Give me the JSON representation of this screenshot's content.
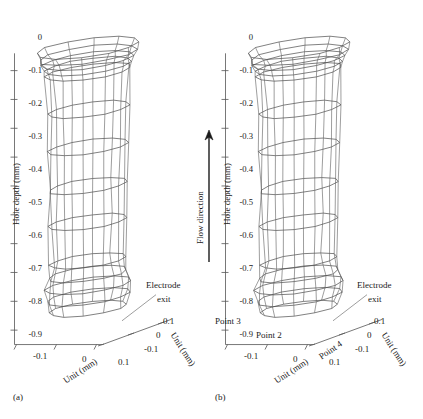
{
  "figure": {
    "type": "two-panel-3d-wireframe",
    "background": "#ffffff",
    "line_color": "#4a4a4a"
  },
  "chart_data": {
    "type": "line",
    "title": "",
    "panels": [
      {
        "caption": "(a)",
        "ylabel": "Hole depth (mm)",
        "xlabel": "Unit (mm)",
        "zlabel": "Unit (mm)",
        "yticks": [
          "0",
          "-0.1",
          "-0.2",
          "-0.3",
          "-0.4",
          "-0.5",
          "-0.6",
          "-0.7",
          "-0.8",
          "-0.9"
        ],
        "ytick_values": [
          0,
          -0.1,
          -0.2,
          -0.3,
          -0.4,
          -0.5,
          -0.6,
          -0.7,
          -0.8,
          -0.9
        ],
        "xticks": [
          "-0.1",
          "0",
          "0.1"
        ],
        "xtick_values": [
          -0.1,
          0,
          0.1
        ],
        "zticks": [
          "0.1",
          "0",
          "-0.1"
        ],
        "ztick_values": [
          0.1,
          0,
          -0.1
        ],
        "ylim": [
          -0.95,
          0.08
        ],
        "xlim": [
          -0.12,
          0.12
        ],
        "zlim": [
          -0.12,
          0.12
        ],
        "annotations": [
          "Electrode exit"
        ],
        "point_labels": [],
        "ring_depths": [
          0.04,
          0.015,
          -0.005,
          -0.025,
          -0.045,
          -0.175,
          -0.305,
          -0.44,
          -0.565,
          -0.7,
          -0.745,
          -0.785,
          -0.825,
          -0.865
        ],
        "ring_radii": [
          0.105,
          0.098,
          0.092,
          0.088,
          0.086,
          0.082,
          0.08,
          0.079,
          0.078,
          0.076,
          0.08,
          0.085,
          0.084,
          0.078
        ],
        "description": "Wireframe of a drilled hole profile, flared inlet at top, slightly tapering bore, bulged electrode exit at bottom."
      },
      {
        "caption": "(b)",
        "ylabel": "Hole depth (mm)",
        "xlabel": "Unit (mm)",
        "zlabel": "Unit (mm)",
        "yticks": [
          "0",
          "-0.1",
          "-0.2",
          "-0.3",
          "-0.4",
          "-0.5",
          "-0.6",
          "-0.7",
          "-0.8",
          "-0.9"
        ],
        "ytick_values": [
          0,
          -0.1,
          -0.2,
          -0.3,
          -0.4,
          -0.5,
          -0.6,
          -0.7,
          -0.8,
          -0.9
        ],
        "xticks": [
          "-0.1",
          "0",
          "0.1"
        ],
        "xtick_values": [
          -0.1,
          0,
          0.1
        ],
        "zticks": [
          "0.1",
          "0",
          "-0.1"
        ],
        "ztick_values": [
          0.1,
          0,
          -0.1
        ],
        "ylim": [
          -0.95,
          0.08
        ],
        "xlim": [
          -0.12,
          0.12
        ],
        "zlim": [
          -0.12,
          0.12
        ],
        "annotations": [
          "Electrode exit"
        ],
        "point_labels": [
          "Point 2",
          "Point 3",
          "Point 4"
        ],
        "ring_depths": [
          0.04,
          0.015,
          -0.005,
          -0.025,
          -0.045,
          -0.175,
          -0.305,
          -0.44,
          -0.565,
          -0.7,
          -0.745,
          -0.785,
          -0.825,
          -0.865
        ],
        "ring_radii": [
          0.105,
          0.098,
          0.092,
          0.088,
          0.086,
          0.082,
          0.08,
          0.079,
          0.078,
          0.076,
          0.082,
          0.088,
          0.086,
          0.078
        ],
        "description": "Wireframe of a drilled hole profile with measurement points 2, 3 and 4 marked near the electrode exit."
      }
    ],
    "flow_arrow": {
      "label": "Flow direction",
      "direction": "up"
    }
  },
  "labels": {
    "hole_depth": "Hole depth (mm)",
    "unit_mm": "Unit (mm)",
    "electrode": "Electrode",
    "exit": "exit",
    "flow_direction": "Flow direction",
    "point2": "Point 2",
    "point3": "Point 3",
    "point4": "Point 4",
    "cap_a": "(a)",
    "cap_b": "(b)",
    "y0": "0",
    "y1": "-0.1",
    "y2": "-0.2",
    "y3": "-0.3",
    "y4": "-0.4",
    "y5": "-0.5",
    "y6": "-0.6",
    "y7": "-0.7",
    "y8": "-0.8",
    "y9": "-0.9",
    "xn1": "-0.1",
    "x0": "0",
    "xp1": "0.1",
    "zp1": "0.1",
    "z0": "0",
    "zn1": "-0.1"
  }
}
